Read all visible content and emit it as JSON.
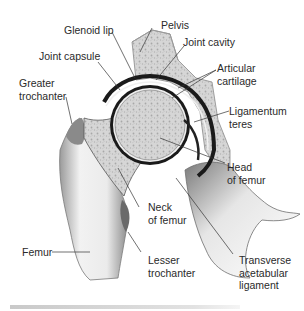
{
  "diagram": {
    "labels": {
      "glenoid_lip": "Glenoid lip",
      "pelvis": "Pelvis",
      "joint_capsule": "Joint capsule",
      "joint_cavity": "Joint cavity",
      "greater_trochanter": "Greater\ntrochanter",
      "articular_cartilage": "Articular\ncartilage",
      "ligamentum_teres": "Ligamentum\nteres",
      "head_of_femur": "Head\nof femur",
      "neck_of_femur": "Neck\nof femur",
      "femur": "Femur",
      "lesser_trochanter": "Lesser\ntrochanter",
      "transverse_acetabular_ligament": "Transverse\nacetabular\nligament"
    },
    "colors": {
      "bone_fill": "#d9d9d9",
      "bone_spongy": "#bdbdbd",
      "cartilage_dark": "#1a1a1a",
      "femur_shaft": "#e8e8e8",
      "leader_line": "#333333",
      "text": "#2a2a2a"
    }
  }
}
